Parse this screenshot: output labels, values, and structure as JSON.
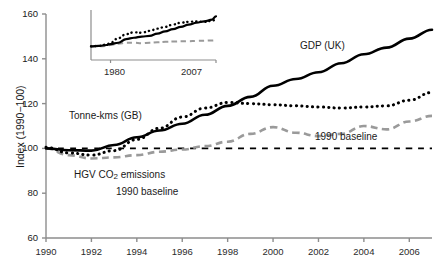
{
  "chart_data": {
    "type": "line",
    "title": "",
    "xlabel": "",
    "ylabel": "Index (1990−100)",
    "xlim": [
      1990,
      2007
    ],
    "ylim": [
      60,
      160
    ],
    "grid": false,
    "legend_position": "inline-annotations",
    "xticks": [
      "1990",
      "1992",
      "1994",
      "1996",
      "1998",
      "2000",
      "2002",
      "2004",
      "2006"
    ],
    "yticks": [
      "60",
      "80",
      "100",
      "120",
      "140",
      "160"
    ],
    "x": [
      1990,
      1991,
      1992,
      1993,
      1994,
      1995,
      1996,
      1997,
      1998,
      1999,
      2000,
      2001,
      2002,
      2003,
      2004,
      2005,
      2006,
      2007
    ],
    "series": [
      {
        "name": "GDP (UK)",
        "style": "solid",
        "color": "#000000",
        "values": [
          100,
          99.2,
          99.0,
          101.5,
          105.0,
          108.0,
          111.0,
          115.0,
          119.0,
          123.0,
          128.0,
          131.0,
          134.0,
          138.0,
          142.0,
          145.0,
          149.0,
          153.0
        ]
      },
      {
        "name": "Tonne-kms (GB)",
        "style": "dotted",
        "color": "#000000",
        "values": [
          100.5,
          98.0,
          97.0,
          99.0,
          104.0,
          109.0,
          114.0,
          118.0,
          120.5,
          120.0,
          119.5,
          119.0,
          118.5,
          118.0,
          118.5,
          119.0,
          121.5,
          125.0
        ]
      },
      {
        "name": "HGV CO2 emissions (UK)",
        "style": "dashed",
        "color": "#9a9a9a",
        "values": [
          100,
          97.0,
          95.5,
          96.0,
          97.0,
          98.5,
          99.5,
          101.0,
          103.0,
          106.5,
          109.5,
          107.0,
          105.5,
          106.5,
          110.0,
          108.5,
          112.0,
          114.5
        ]
      },
      {
        "name": "1990 baseline",
        "style": "long-dashed",
        "color": "#000000",
        "values": [
          100,
          100,
          100,
          100,
          100,
          100,
          100,
          100,
          100,
          100,
          100,
          100,
          100,
          100,
          100,
          100,
          100,
          100
        ]
      }
    ],
    "annotations": [
      {
        "id": "gdp-label",
        "text": "GDP (UK)"
      },
      {
        "id": "tonne-kms-label",
        "text": "Tonne-kms (GB)"
      },
      {
        "id": "hgv-label-line1-a",
        "text": "HGV CO"
      },
      {
        "id": "hgv-label-sub",
        "text": "2"
      },
      {
        "id": "hgv-label-line1-b",
        "text": " emissions"
      },
      {
        "id": "hgv-label-line2",
        "text": "(UK)"
      },
      {
        "id": "baseline-label",
        "text": "1990 baseline"
      }
    ],
    "inset": {
      "type": "line",
      "xticks": [
        "1980",
        "2007"
      ],
      "xlim": [
        1975,
        2007
      ],
      "ylim": [
        140,
        162
      ],
      "x": [
        1975,
        1977,
        1979,
        1980,
        1982,
        1984,
        1986,
        1988,
        1990,
        1992,
        1994,
        1996,
        1998,
        2000,
        2002,
        2004,
        2006,
        2007
      ],
      "series": [
        {
          "name": "GDP (UK)",
          "style": "solid",
          "color": "#000000",
          "values": [
            146.0,
            146.2,
            146.6,
            147.0,
            147.6,
            149.2,
            149.8,
            150.3,
            150.6,
            151.6,
            152.6,
            153.6,
            154.6,
            155.6,
            156.4,
            157.0,
            157.8,
            159.2
          ]
        },
        {
          "name": "Tonne-kms (GB)",
          "style": "dotted",
          "color": "#000000",
          "values": [
            146.0,
            146.2,
            146.8,
            147.6,
            149.6,
            151.4,
            152.2,
            152.0,
            152.8,
            153.8,
            154.6,
            155.6,
            156.4,
            156.8,
            157.0,
            156.8,
            157.2,
            158.0
          ]
        },
        {
          "name": "HGV CO2 emissions (UK)",
          "style": "dashed",
          "color": "#9a9a9a",
          "values": [
            146.0,
            146.0,
            146.2,
            146.6,
            147.2,
            147.6,
            147.6,
            147.4,
            147.6,
            147.8,
            148.0,
            148.1,
            148.2,
            148.3,
            148.4,
            148.5,
            148.6,
            148.7
          ]
        }
      ]
    }
  }
}
